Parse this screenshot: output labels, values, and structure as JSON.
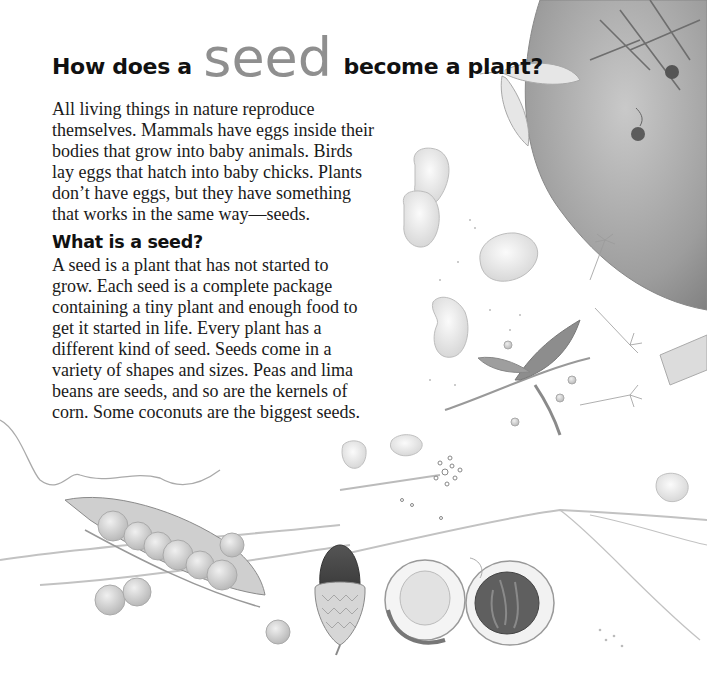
{
  "title": {
    "before": "How does a",
    "emphasis": "seed",
    "after": "become a plant?"
  },
  "intro": {
    "lines": [
      "All living things in nature reproduce",
      "themselves. Mammals have eggs inside their",
      "bodies that grow into baby animals. Birds",
      "lay eggs that hatch into baby chicks. Plants",
      "don’t have eggs, but they have something",
      "that works in the same way—seeds."
    ]
  },
  "section": {
    "heading": "What is a seed?",
    "lines": [
      "A seed is a plant that has not started to",
      "grow. Each seed is a complete package",
      "containing a tiny plant and enough food to",
      "get it started in life. Every plant has a",
      "different kind of seed. Seeds come in a",
      "variety of shapes and sizes. Peas and lima",
      "beans are seeds, and so are the kernels of",
      "corn. Some coconuts are the biggest seeds."
    ]
  },
  "illustrations": {
    "items": [
      "coconut-shell",
      "maple-seed",
      "lima-beans",
      "dandelion-seeds",
      "pea-pod",
      "peas",
      "acorn",
      "coconut-halves",
      "grass-stems"
    ]
  },
  "colors": {
    "text": "#1a1a1a",
    "emphasis": "#8f8f8f",
    "pencil": "#9a9a9a",
    "shade": "#7a7a7a"
  }
}
